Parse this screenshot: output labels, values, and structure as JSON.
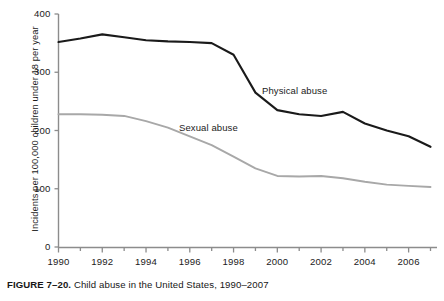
{
  "figure": {
    "caption_label": "FIGURE 7–20.",
    "caption_text": " Child abuse in the United States, 1990–2007"
  },
  "axes": {
    "y_title": "Incidents per 100,000 children under 18 per year",
    "y_ticks": [
      "0",
      "100",
      "200",
      "300",
      "400"
    ],
    "x_ticks": [
      "1990",
      "1992",
      "1994",
      "1996",
      "1998",
      "2000",
      "2002",
      "2004",
      "2006"
    ]
  },
  "annotations": {
    "physical_abuse": "Physical abuse",
    "sexual_abuse": "Sexual abuse"
  },
  "colors": {
    "physical_abuse_line": "#1a1a1a",
    "sexual_abuse_line": "#a8a8a8",
    "axis": "#8c8c8c",
    "text": "#1b1b1b"
  },
  "chart_data": {
    "type": "line",
    "title": "Child abuse in the United States, 1990–2007",
    "xlabel": "",
    "ylabel": "Incidents per 100,000 children under 18 per year",
    "xlim": [
      1990,
      2007
    ],
    "ylim": [
      0,
      400
    ],
    "y_tick_values": [
      0,
      100,
      200,
      300,
      400
    ],
    "x_tick_values": [
      1990,
      1992,
      1994,
      1996,
      1998,
      2000,
      2002,
      2004,
      2006
    ],
    "x_minor_tick_step": 1,
    "grid": false,
    "legend": "inline-annotations",
    "x": [
      1990,
      1991,
      1992,
      1993,
      1994,
      1995,
      1996,
      1997,
      1998,
      1999,
      2000,
      2001,
      2002,
      2003,
      2004,
      2005,
      2006,
      2007
    ],
    "series": [
      {
        "name": "Physical abuse",
        "color": "#1a1a1a",
        "values": [
          352,
          358,
          365,
          360,
          355,
          353,
          352,
          350,
          330,
          265,
          235,
          228,
          225,
          232,
          212,
          200,
          190,
          172
        ]
      },
      {
        "name": "Sexual abuse",
        "color": "#a8a8a8",
        "values": [
          228,
          228,
          227,
          225,
          216,
          205,
          190,
          175,
          155,
          135,
          122,
          121,
          122,
          118,
          112,
          107,
          105,
          103
        ]
      }
    ]
  }
}
